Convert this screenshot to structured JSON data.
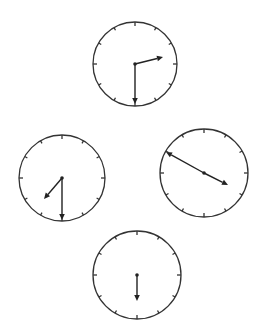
{
  "figure": {
    "colors": {
      "face_stroke": "#333333",
      "hand": "#222222",
      "background": "#ffffff"
    }
  },
  "clocks": [
    {
      "id": "top",
      "cx": 135,
      "cy": 64,
      "r": 42,
      "time": "2:30",
      "hands": [
        {
          "type": "hour",
          "tip": [
            163,
            57
          ]
        },
        {
          "type": "minute",
          "tip": [
            135,
            104
          ]
        }
      ]
    },
    {
      "id": "left",
      "cx": 62,
      "cy": 178,
      "r": 43,
      "time": "7:30",
      "hands": [
        {
          "type": "hour",
          "tip": [
            44,
            199
          ]
        },
        {
          "type": "minute",
          "tip": [
            62,
            220
          ]
        }
      ]
    },
    {
      "id": "right",
      "cx": 204,
      "cy": 173,
      "r": 44,
      "time": "4:50",
      "hands": [
        {
          "type": "minute",
          "tip": [
            166,
            152
          ]
        },
        {
          "type": "hour",
          "tip": [
            228,
            185
          ]
        }
      ]
    },
    {
      "id": "bottom",
      "cx": 137,
      "cy": 275,
      "r": 44,
      "time": "6:30",
      "hands": [
        {
          "type": "hour",
          "tip": [
            137,
            301
          ]
        }
      ]
    }
  ]
}
